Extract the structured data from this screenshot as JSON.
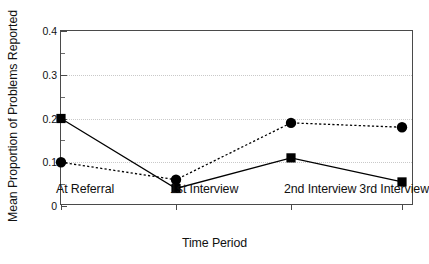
{
  "chart_data": {
    "type": "line",
    "title": "",
    "subtitle": "",
    "xlabel": "Time Period",
    "ylabel": "Mean Proportion of Problems Reported",
    "categories": [
      "At Referral",
      "1st Interview",
      "2nd Interview",
      "3rd Interview"
    ],
    "ylim": [
      0,
      0.4
    ],
    "yticks": [
      0,
      0.1,
      0.2,
      0.3,
      0.4
    ],
    "ytick_labels": [
      "0",
      "0.1",
      "0.2",
      "0.3",
      "0.4"
    ],
    "yminor_ticks": [
      0.05,
      0.15,
      0.25,
      0.35
    ],
    "gridlines": [
      0.1,
      0.2,
      0.3
    ],
    "grid": "horizontal-dotted",
    "legend": "none",
    "legend_position": "none",
    "annotations": [],
    "series": [
      {
        "name": "Series 1",
        "marker": "square",
        "line_style": "solid",
        "color": "#000000",
        "values": [
          0.2,
          0.04,
          0.11,
          0.055
        ]
      },
      {
        "name": "Series 2",
        "marker": "circle",
        "line_style": "dotted",
        "color": "#000000",
        "values": [
          0.1,
          0.06,
          0.19,
          0.18
        ]
      }
    ]
  },
  "axis_colors": {
    "frame": "#4a4a4a",
    "grid": "#c9c9c9",
    "text": "#111111",
    "marker": "#000000"
  }
}
